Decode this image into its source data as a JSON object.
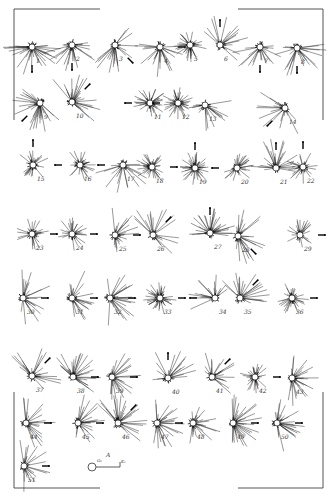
{
  "figure": {
    "frame": {
      "color": "#555555"
    },
    "legend": {
      "label": "A",
      "start_label": "O₁",
      "end_label": "K₁"
    },
    "diagrams": [
      {
        "n": "1",
        "x": 32,
        "y": 47,
        "a": 160,
        "d": "s",
        "arrow": "s"
      },
      {
        "n": "2",
        "x": 72,
        "y": 45,
        "a": 100,
        "d": "s",
        "arrow": "s"
      },
      {
        "n": "3",
        "x": 115,
        "y": 45,
        "a": 80,
        "d": "se",
        "arrow": "se"
      },
      {
        "n": "4",
        "x": 160,
        "y": 47,
        "a": 90,
        "d": "s",
        "arrow": "e"
      },
      {
        "n": "5",
        "x": 190,
        "y": 45,
        "a": 200,
        "d": "all",
        "arrow": ""
      },
      {
        "n": "6",
        "x": 220,
        "y": 45,
        "a": 60,
        "d": "ne",
        "arrow": "n"
      },
      {
        "n": "7",
        "x": 260,
        "y": 47,
        "a": 60,
        "d": "s",
        "arrow": "s"
      },
      {
        "n": "8",
        "x": 297,
        "y": 48,
        "a": 110,
        "d": "s",
        "arrow": "s"
      },
      {
        "n": "9",
        "x": 40,
        "y": 103,
        "a": 140,
        "d": "sw",
        "arrow": "sw"
      },
      {
        "n": "10",
        "x": 72,
        "y": 102,
        "a": 140,
        "d": "ne",
        "arrow": "ne"
      },
      {
        "n": "11",
        "x": 150,
        "y": 103,
        "a": 160,
        "d": "all",
        "arrow": "w"
      },
      {
        "n": "12",
        "x": 178,
        "y": 103,
        "a": 220,
        "d": "all",
        "arrow": "w"
      },
      {
        "n": "13",
        "x": 205,
        "y": 105,
        "a": 60,
        "d": "s",
        "arrow": ""
      },
      {
        "n": "14",
        "x": 285,
        "y": 108,
        "a": 50,
        "d": "sw",
        "arrow": "sw"
      },
      {
        "n": "15",
        "x": 33,
        "y": 165,
        "a": 100,
        "d": "all",
        "arrow": "n"
      },
      {
        "n": "16",
        "x": 80,
        "y": 165,
        "a": 120,
        "d": "all",
        "arrow": "w"
      },
      {
        "n": "17",
        "x": 123,
        "y": 165,
        "a": 60,
        "d": "s",
        "arrow": "w"
      },
      {
        "n": "18",
        "x": 152,
        "y": 167,
        "a": 180,
        "d": "all",
        "arrow": "e"
      },
      {
        "n": "19",
        "x": 195,
        "y": 168,
        "a": 250,
        "d": "all",
        "arrow": "n"
      },
      {
        "n": "20",
        "x": 237,
        "y": 168,
        "a": 120,
        "d": "all",
        "arrow": "w"
      },
      {
        "n": "21",
        "x": 276,
        "y": 168,
        "a": 100,
        "d": "n",
        "arrow": "n"
      },
      {
        "n": "22",
        "x": 303,
        "y": 167,
        "a": 120,
        "d": "all",
        "arrow": "n"
      },
      {
        "n": "23",
        "x": 32,
        "y": 234,
        "a": 90,
        "d": "all",
        "arrow": "e"
      },
      {
        "n": "24",
        "x": 72,
        "y": 234,
        "a": 120,
        "d": "all",
        "arrow": "e"
      },
      {
        "n": "25",
        "x": 115,
        "y": 235,
        "a": 80,
        "d": "e",
        "arrow": "e"
      },
      {
        "n": "26",
        "x": 153,
        "y": 235,
        "a": 60,
        "d": "ne",
        "arrow": "ne"
      },
      {
        "n": "27",
        "x": 210,
        "y": 233,
        "a": 160,
        "d": "n",
        "arrow": "n"
      },
      {
        "n": "28",
        "x": 238,
        "y": 236,
        "a": 100,
        "d": "e",
        "arrow": "se"
      },
      {
        "n": "29",
        "x": 300,
        "y": 235,
        "a": 100,
        "d": "all",
        "arrow": "e"
      },
      {
        "n": "30",
        "x": 23,
        "y": 298,
        "a": 80,
        "d": "e",
        "arrow": "e"
      },
      {
        "n": "31",
        "x": 72,
        "y": 298,
        "a": 90,
        "d": "e",
        "arrow": "e"
      },
      {
        "n": "32",
        "x": 110,
        "y": 298,
        "a": 90,
        "d": "e",
        "arrow": "e"
      },
      {
        "n": "33",
        "x": 160,
        "y": 298,
        "a": 250,
        "d": "all",
        "arrow": "e"
      },
      {
        "n": "34",
        "x": 215,
        "y": 298,
        "a": 60,
        "d": "nw",
        "arrow": "w"
      },
      {
        "n": "35",
        "x": 240,
        "y": 298,
        "a": 80,
        "d": "ne",
        "arrow": "ne"
      },
      {
        "n": "36",
        "x": 292,
        "y": 298,
        "a": 120,
        "d": "all",
        "arrow": "e"
      },
      {
        "n": "37",
        "x": 32,
        "y": 376,
        "a": 90,
        "d": "ne",
        "arrow": "ne"
      },
      {
        "n": "38",
        "x": 73,
        "y": 377,
        "a": 150,
        "d": "ne",
        "arrow": "e"
      },
      {
        "n": "39",
        "x": 112,
        "y": 377,
        "a": 100,
        "d": "e",
        "arrow": "e"
      },
      {
        "n": "40",
        "x": 168,
        "y": 378,
        "a": 60,
        "d": "n",
        "arrow": "n"
      },
      {
        "n": "41",
        "x": 212,
        "y": 377,
        "a": 70,
        "d": "ne",
        "arrow": "ne"
      },
      {
        "n": "42",
        "x": 255,
        "y": 377,
        "a": 140,
        "d": "all",
        "arrow": "e"
      },
      {
        "n": "43",
        "x": 292,
        "y": 378,
        "a": 110,
        "d": "e",
        "arrow": ""
      },
      {
        "n": "44",
        "x": 26,
        "y": 423,
        "a": 80,
        "d": "e",
        "arrow": "e"
      },
      {
        "n": "45",
        "x": 78,
        "y": 423,
        "a": 90,
        "d": "e",
        "arrow": "e"
      },
      {
        "n": "46",
        "x": 118,
        "y": 423,
        "a": 140,
        "d": "ne",
        "arrow": "ne"
      },
      {
        "n": "47",
        "x": 157,
        "y": 423,
        "a": 90,
        "d": "e",
        "arrow": "e"
      },
      {
        "n": "48",
        "x": 193,
        "y": 423,
        "a": 100,
        "d": "e",
        "arrow": ""
      },
      {
        "n": "49",
        "x": 233,
        "y": 423,
        "a": 160,
        "d": "e",
        "arrow": "e"
      },
      {
        "n": "50",
        "x": 277,
        "y": 423,
        "a": 100,
        "d": "e",
        "arrow": "e"
      },
      {
        "n": "51",
        "x": 24,
        "y": 466,
        "a": 80,
        "d": "e",
        "arrow": "e"
      }
    ]
  }
}
